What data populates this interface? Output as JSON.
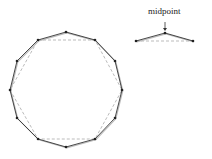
{
  "diagram": {
    "title": "",
    "inset_label": "midpoint",
    "colors": {
      "solid_line": "#333333",
      "shadow_line": "#bbbbbb",
      "dashed_line": "#aaaaaa",
      "point": "#222222"
    },
    "hexagon": [
      [
        38,
        40
      ],
      [
        95,
        40
      ],
      [
        122,
        90
      ],
      [
        95,
        139
      ],
      [
        38,
        139
      ],
      [
        10,
        90
      ]
    ],
    "dodecagon": [
      [
        66,
        32
      ],
      [
        95,
        40
      ],
      [
        115,
        61
      ],
      [
        122,
        90
      ],
      [
        115,
        118
      ],
      [
        95,
        139
      ],
      [
        66,
        147
      ],
      [
        38,
        139
      ],
      [
        17,
        118
      ],
      [
        10,
        90
      ],
      [
        17,
        61
      ],
      [
        38,
        40
      ]
    ],
    "inset": {
      "base": [
        [
          136,
          41
        ],
        [
          193,
          41
        ]
      ],
      "polyline": [
        [
          136,
          41
        ],
        [
          165,
          33
        ],
        [
          193,
          41
        ]
      ],
      "arrow_from": [
        165,
        22
      ],
      "arrow_to": [
        165,
        31
      ]
    }
  }
}
